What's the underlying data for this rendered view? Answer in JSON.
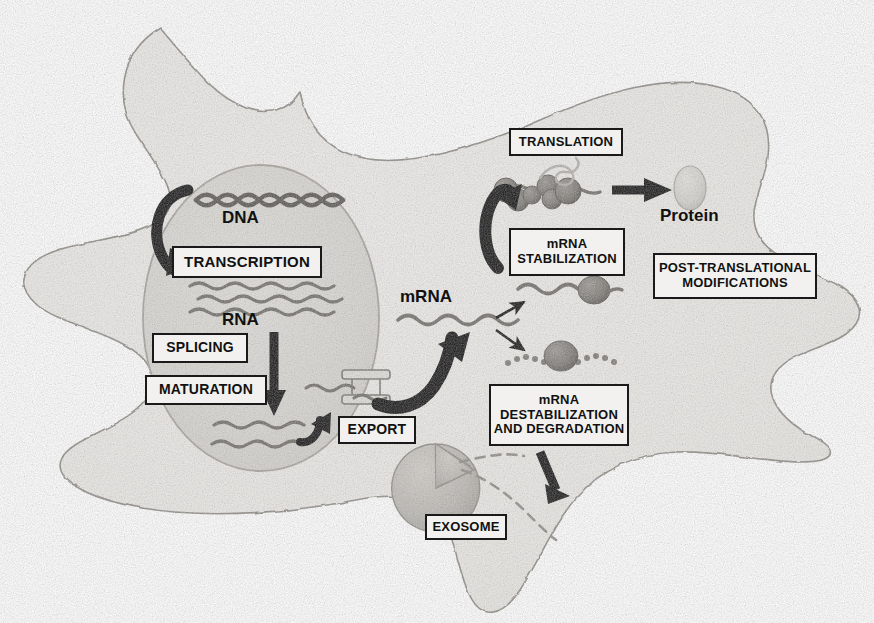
{
  "diagram": {
    "style": {
      "cytoplasm_fill": "#eceae7",
      "cytoplasm_stroke": "#9a968f",
      "nucleus_fill": "#d9d7d2",
      "nucleus_stroke": "#a5a19a",
      "label_box_fill": "#f2f1ef",
      "label_box_stroke": "#1a1a1a",
      "text_color": "#111111",
      "arrow_dark": "#121212",
      "rna_strand": "#6f6c66",
      "dna_color": "#555250",
      "ribosome_fill": "#7d7a74",
      "protein_fill": "#d2d0cb",
      "exosome_fill": "#b9b6b0"
    },
    "boxes": [
      {
        "id": "transcription",
        "label": "TRANSCRIPTION",
        "x": 172,
        "y": 246,
        "w": 150,
        "h": 32,
        "font_size": 15
      },
      {
        "id": "splicing",
        "label": "SPLICING",
        "x": 152,
        "y": 333,
        "w": 96,
        "h": 30,
        "font_size": 14
      },
      {
        "id": "maturation",
        "label": "MATURATION",
        "x": 145,
        "y": 375,
        "w": 122,
        "h": 30,
        "font_size": 14
      },
      {
        "id": "export",
        "label": "EXPORT",
        "x": 338,
        "y": 416,
        "w": 78,
        "h": 28,
        "font_size": 14
      },
      {
        "id": "translation",
        "label": "TRANSLATION",
        "x": 509,
        "y": 128,
        "w": 114,
        "h": 28,
        "font_size": 13
      },
      {
        "id": "mrna-stabilization",
        "label": "mRNA\nSTABILIZATION",
        "x": 509,
        "y": 228,
        "w": 116,
        "h": 48,
        "font_size": 13
      },
      {
        "id": "post-translational-modifications",
        "label": "POST-TRANSLATIONAL\nMODIFICATIONS",
        "x": 653,
        "y": 253,
        "w": 164,
        "h": 46,
        "font_size": 13
      },
      {
        "id": "mrna-destabilization",
        "label": "mRNA\nDESTABILIZATION\nAND DEGRADATION",
        "x": 489,
        "y": 384,
        "w": 140,
        "h": 62,
        "font_size": 13
      },
      {
        "id": "exosome",
        "label": "EXOSOME",
        "x": 425,
        "y": 514,
        "w": 82,
        "h": 26,
        "font_size": 13
      }
    ],
    "plain_labels": [
      {
        "id": "dna",
        "label": "DNA",
        "x": 222,
        "y": 218,
        "font_size": 17
      },
      {
        "id": "rna",
        "label": "RNA",
        "x": 222,
        "y": 310,
        "font_size": 17
      },
      {
        "id": "mrna",
        "label": "mRNA",
        "x": 400,
        "y": 291,
        "font_size": 17
      },
      {
        "id": "protein",
        "label": "Protein",
        "x": 660,
        "y": 200,
        "font_size": 17
      }
    ],
    "structures": [
      {
        "id": "cell-membrane",
        "name": "star-shaped cell outline"
      },
      {
        "id": "nucleus",
        "name": "nucleus ellipse"
      },
      {
        "id": "dna-helix",
        "name": "double helix of 8 crossings"
      },
      {
        "id": "nascent-rna-strands",
        "name": "three wavy pre-mRNA strands"
      },
      {
        "id": "mature-rna-strands",
        "name": "two wavy mature mRNA strands"
      },
      {
        "id": "nuclear-pore",
        "name": "nuclear pore with two bars"
      },
      {
        "id": "polysome",
        "name": "ribosomes translating mRNA"
      },
      {
        "id": "protein-ellipse",
        "name": "folded protein product"
      },
      {
        "id": "stabilized-mrna",
        "name": "mRNA bound by stabilizing factor"
      },
      {
        "id": "degrading-mrna",
        "name": "fragmented mRNA with nuclease"
      },
      {
        "id": "exosome-complex",
        "name": "exosome degradation machine"
      }
    ],
    "arrows": [
      {
        "id": "dna-to-transcription",
        "type": "curved-hook"
      },
      {
        "id": "rna-to-maturation",
        "type": "straight-down"
      },
      {
        "id": "mrna-export",
        "type": "curved-hook"
      },
      {
        "id": "mrna-to-stabilization",
        "type": "small-dashed-up"
      },
      {
        "id": "mrna-to-degradation",
        "type": "small-dashed-down"
      },
      {
        "id": "stabilization-to-translation",
        "type": "curved-hook"
      },
      {
        "id": "translation-to-protein",
        "type": "straight-right"
      },
      {
        "id": "degradation-to-exosome",
        "type": "straight-diagonal"
      }
    ]
  }
}
